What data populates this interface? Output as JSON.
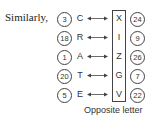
{
  "intro": "Similarly,",
  "rows": [
    {
      "left_num": "3",
      "letter": "C",
      "opposite": "X",
      "right_num": "24"
    },
    {
      "left_num": "18",
      "letter": "R",
      "opposite": "I",
      "right_num": "9"
    },
    {
      "left_num": "1",
      "letter": "A",
      "opposite": "Z",
      "right_num": "26"
    },
    {
      "left_num": "20",
      "letter": "T",
      "opposite": "G",
      "right_num": "7"
    },
    {
      "left_num": "5",
      "letter": "E",
      "opposite": "V",
      "right_num": "22"
    }
  ],
  "caption": "Opposite letter",
  "icons": {
    "arrow": "double-headed-arrow-icon"
  }
}
